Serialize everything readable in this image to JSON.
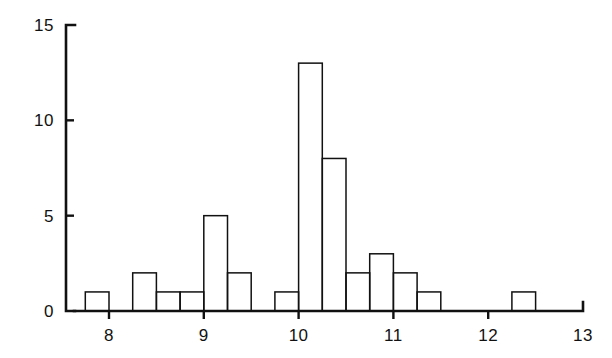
{
  "chart_data": {
    "type": "bar",
    "title": "",
    "subtitle": "",
    "xlabel": "",
    "ylabel": "",
    "xlim": [
      7.5,
      13.0
    ],
    "ylim": [
      0,
      15
    ],
    "grid": false,
    "legend": null,
    "bin_width": 0.25,
    "x_ticks": [
      {
        "value": 8,
        "label": "8"
      },
      {
        "value": 9,
        "label": "9"
      },
      {
        "value": 10,
        "label": "10"
      },
      {
        "value": 11,
        "label": "11"
      },
      {
        "value": 12,
        "label": "12"
      },
      {
        "value": 13,
        "label": "13"
      }
    ],
    "y_ticks": [
      {
        "value": 0,
        "label": "0"
      },
      {
        "value": 5,
        "label": "5"
      },
      {
        "value": 10,
        "label": "10"
      },
      {
        "value": 15,
        "label": "15"
      }
    ],
    "bins": [
      {
        "x0": 7.75,
        "x1": 8.0,
        "count": 1
      },
      {
        "x0": 8.25,
        "x1": 8.5,
        "count": 2
      },
      {
        "x0": 8.5,
        "x1": 8.75,
        "count": 1
      },
      {
        "x0": 8.75,
        "x1": 9.0,
        "count": 1
      },
      {
        "x0": 9.0,
        "x1": 9.25,
        "count": 5
      },
      {
        "x0": 9.25,
        "x1": 9.5,
        "count": 2
      },
      {
        "x0": 9.75,
        "x1": 10.0,
        "count": 1
      },
      {
        "x0": 10.0,
        "x1": 10.25,
        "count": 13
      },
      {
        "x0": 10.25,
        "x1": 10.5,
        "count": 8
      },
      {
        "x0": 10.5,
        "x1": 10.75,
        "count": 2
      },
      {
        "x0": 10.75,
        "x1": 11.0,
        "count": 3
      },
      {
        "x0": 11.0,
        "x1": 11.25,
        "count": 2
      },
      {
        "x0": 11.25,
        "x1": 11.5,
        "count": 1
      },
      {
        "x0": 12.25,
        "x1": 12.5,
        "count": 1
      }
    ],
    "categories": [
      7.75,
      8.25,
      8.5,
      8.75,
      9.0,
      9.25,
      9.75,
      10.0,
      10.25,
      10.5,
      10.75,
      11.0,
      11.25,
      12.25
    ],
    "values": [
      1,
      2,
      1,
      1,
      5,
      2,
      1,
      13,
      8,
      2,
      3,
      2,
      1,
      1
    ],
    "colors": {
      "ink": "#111111",
      "background": "#ffffff",
      "bar_fill": "none",
      "bar_stroke": "#111111"
    },
    "geometry": {
      "x_pixel_of_8": 109,
      "x_pixel_of_13": 583,
      "y_pixel_of_0": 311,
      "y_pixel_of_15": 25,
      "axis_left": 66,
      "axis_right": 583,
      "x_axis_start": 74
    }
  }
}
